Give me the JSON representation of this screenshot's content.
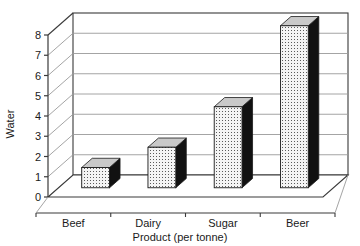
{
  "chart_data": {
    "type": "bar",
    "title": "",
    "subtitle": "",
    "xlabel": "Product (per tonne)",
    "ylabel": "Water",
    "categories": [
      "Beef",
      "Dairy",
      "Sugar",
      "Beer"
    ],
    "values": [
      1,
      2,
      4,
      8
    ],
    "series": [
      {
        "name": "Water",
        "values": [
          1,
          2,
          4,
          8
        ]
      }
    ],
    "ylim": [
      0,
      8
    ],
    "ytick_labels": [
      "0",
      "1",
      "2",
      "3",
      "4",
      "5",
      "6",
      "7",
      "8"
    ],
    "ytick_values": [
      0,
      1,
      2,
      3,
      4,
      5,
      6,
      7,
      8
    ],
    "grid": true,
    "grid_axis": "y",
    "legend": false,
    "legend_position": "none",
    "three_d": true,
    "annotations": []
  },
  "style": {
    "background": "#ffffff",
    "axis_color": "#3a3a3a",
    "grid_color": "#9a9a9a",
    "bar_front": "#f2f2f2",
    "bar_top": "#c9c9c9",
    "bar_side": "#111111",
    "bar_outline": "#1a1a1a",
    "text_color": "#1a1a1a"
  }
}
